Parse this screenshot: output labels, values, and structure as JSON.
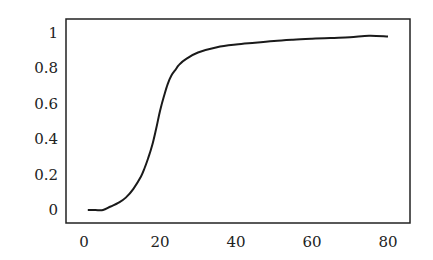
{
  "chart_data": {
    "type": "line",
    "title": "",
    "xlabel": "",
    "ylabel": "",
    "xlim": [
      -5,
      85
    ],
    "ylim": [
      -0.07,
      1.07
    ],
    "grid": false,
    "legend": null,
    "x_ticks": [
      0,
      20,
      40,
      60,
      80
    ],
    "x_tick_labels": [
      "0",
      "20",
      "40",
      "60",
      "80"
    ],
    "y_ticks": [
      0,
      0.2,
      0.4,
      0.6,
      0.8,
      1
    ],
    "y_tick_labels": [
      "0",
      "0.2",
      "0.4",
      "0.6",
      "0.8",
      "1"
    ],
    "series": [
      {
        "name": "curve",
        "color": "#1a1a1a",
        "x": [
          1,
          3,
          5,
          7,
          9,
          11,
          13,
          15,
          16,
          17,
          18,
          19,
          20,
          21,
          22,
          23,
          24,
          25,
          27,
          30,
          35,
          40,
          45,
          50,
          55,
          60,
          65,
          70,
          75,
          80
        ],
        "y": [
          0.0,
          0.0,
          0.0,
          0.02,
          0.04,
          0.07,
          0.12,
          0.19,
          0.24,
          0.3,
          0.37,
          0.46,
          0.56,
          0.64,
          0.71,
          0.76,
          0.79,
          0.82,
          0.855,
          0.89,
          0.92,
          0.935,
          0.945,
          0.955,
          0.962,
          0.968,
          0.972,
          0.976,
          0.985,
          0.98
        ]
      }
    ]
  }
}
